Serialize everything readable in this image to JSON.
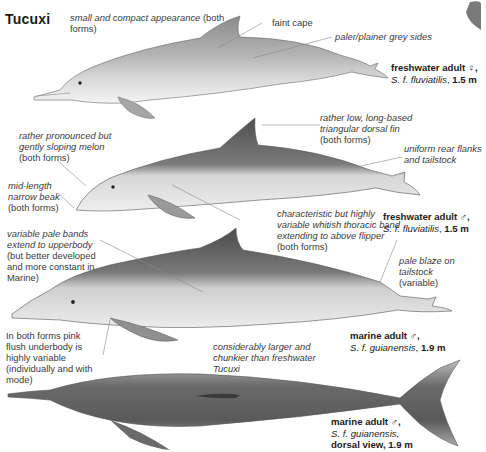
{
  "title": "Tucuxi",
  "notes": {
    "compact_it": "small and compact appearance",
    "compact_rest": " (both forms)",
    "faint_cape": "faint cape",
    "paler_sides": "paler/plainer grey sides",
    "dorsal_fin_it": "rather low, long-based triangular dorsal fin",
    "dorsal_fin_rest": "(both forms)",
    "melon_it": "rather pronounced but gently sloping melon",
    "melon_rest": "(both forms)",
    "beak_it": "mid-length narrow beak",
    "beak_rest": "(both forms)",
    "rear_flanks": "uniform rear flanks and tailstock",
    "thoracic_it": "characteristic but highly variable whitish thoracic band extending to above flipper",
    "thoracic_rest": " (both forms)",
    "pale_bands_it": "variable pale bands extend to upperbody",
    "pale_bands_rest": " (but better developed and more constant in Marine)",
    "pale_blaze_it": "pale blaze on tailstock",
    "pale_blaze_rest": "(variable)",
    "pink_flush": "In both forms pink flush underbody is highly variable (individually and with mode)",
    "larger": "considerably larger and chunkier than freshwater Tucuxi"
  },
  "figures": [
    {
      "form": "freshwater adult ♀,",
      "species": "S. f. fluviatilis",
      "size": "1.5 m"
    },
    {
      "form": "freshwater adult ♂,",
      "species": "S. f. fluviatilis",
      "size": "1.5 m"
    },
    {
      "form": "marine adult ♂,",
      "species": "S. f. guianensis",
      "size": "1.9 m"
    },
    {
      "form": "marine adult ♂,",
      "species": "S. f. guianensis,",
      "size": "dorsal view, 1.9 m"
    }
  ]
}
